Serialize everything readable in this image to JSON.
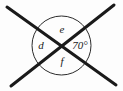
{
  "figure": {
    "kind": "geometry-diagram",
    "background_color": "#fdfdfd",
    "stroke_color": "#1a1a1a",
    "circle_stroke_color": "#2b2b2b",
    "canvas": {
      "width": 123,
      "height": 91
    }
  },
  "circle": {
    "name": "angle-circle",
    "center_x": 61.5,
    "center_y": 45.5,
    "radius": 29.5,
    "stroke_width": 1
  },
  "lines": [
    {
      "name": "line-nw-se",
      "x1": 7,
      "y1": 7,
      "x2": 116,
      "y2": 85,
      "stroke_width": 3
    },
    {
      "name": "line-sw-ne",
      "x1": 11,
      "y1": 86,
      "x2": 114,
      "y2": 5,
      "stroke_width": 3
    }
  ],
  "intersection": {
    "x": 60.5,
    "y": 45.5
  },
  "labels": [
    {
      "id": "top",
      "name": "angle-label-e",
      "text": "e",
      "x": 62,
      "y": 30,
      "position": "top",
      "kind": "variable"
    },
    {
      "id": "left",
      "name": "angle-label-d",
      "text": "d",
      "x": 41,
      "y": 46,
      "position": "left",
      "kind": "variable"
    },
    {
      "id": "bottom",
      "name": "angle-label-f",
      "text": "f",
      "x": 62,
      "y": 62,
      "position": "bottom",
      "kind": "variable"
    },
    {
      "id": "right",
      "name": "angle-label-70deg",
      "text": "70°",
      "x": 80,
      "y": 46,
      "position": "right",
      "kind": "measure"
    }
  ],
  "known_angle": {
    "value": 70,
    "unit": "degrees",
    "display": "70°"
  },
  "unknown_angles": [
    "d",
    "e",
    "f"
  ]
}
